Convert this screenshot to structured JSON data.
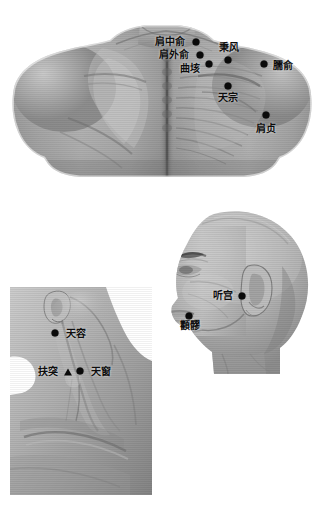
{
  "document": {
    "type": "acupuncture-point-atlas",
    "background_color": "#ffffff",
    "marker_color": "#0a0a0a",
    "label_color": "#0d0d0d",
    "width": 324,
    "height": 505
  },
  "figures": [
    {
      "id": "upper-back",
      "caption": "",
      "description": "Posterior view of upper back and shoulders",
      "points": [
        {
          "label": "肩中俞",
          "marker": "dot",
          "dot_x": 196,
          "dot_y": 42,
          "label_x": 170,
          "label_y": 41
        },
        {
          "label": "肩外俞",
          "marker": "dot",
          "dot_x": 200,
          "dot_y": 55,
          "label_x": 174,
          "label_y": 54
        },
        {
          "label": "曲垓",
          "marker": "dot",
          "dot_x": 209,
          "dot_y": 64,
          "label_x": 190,
          "label_y": 68
        },
        {
          "label": "秉风",
          "marker": "dot",
          "dot_x": 228,
          "dot_y": 60,
          "label_x": 229,
          "label_y": 47
        },
        {
          "label": "臑俞",
          "marker": "dot",
          "dot_x": 264,
          "dot_y": 64,
          "label_x": 283,
          "label_y": 65
        },
        {
          "label": "天宗",
          "marker": "dot",
          "dot_x": 228,
          "dot_y": 86,
          "label_x": 228,
          "label_y": 97
        },
        {
          "label": "肩贞",
          "marker": "dot",
          "dot_x": 266,
          "dot_y": 115,
          "label_x": 266,
          "label_y": 128
        }
      ]
    },
    {
      "id": "lateral-neck",
      "caption": "",
      "description": "Lateral view of neck and clavicle region",
      "points": [
        {
          "label": "天容",
          "marker": "dot",
          "dot_x": 55,
          "dot_y": 333,
          "label_x": 76,
          "label_y": 333
        },
        {
          "label": "扶突",
          "marker": "triangle",
          "dot_x": 68,
          "dot_y": 372,
          "label_x": 48,
          "label_y": 371
        },
        {
          "label": "天窗",
          "marker": "dot",
          "dot_x": 80,
          "dot_y": 371,
          "label_x": 101,
          "label_y": 371
        }
      ]
    },
    {
      "id": "head-profile",
      "caption": "",
      "description": "Lateral view of head showing facial points",
      "points": [
        {
          "label": "听宫",
          "marker": "dot",
          "dot_x": 242,
          "dot_y": 296,
          "label_x": 223,
          "label_y": 295
        },
        {
          "label": "顴髎",
          "marker": "dot",
          "dot_x": 189,
          "dot_y": 316,
          "label_x": 190,
          "label_y": 325
        }
      ]
    }
  ],
  "labels_flat": [
    "肩中俞",
    "肩外俞",
    "曲垓",
    "秉风",
    "臑俞",
    "天宗",
    "肩贞",
    "天容",
    "扶突",
    "天窗",
    "听宫",
    "顴髎"
  ]
}
